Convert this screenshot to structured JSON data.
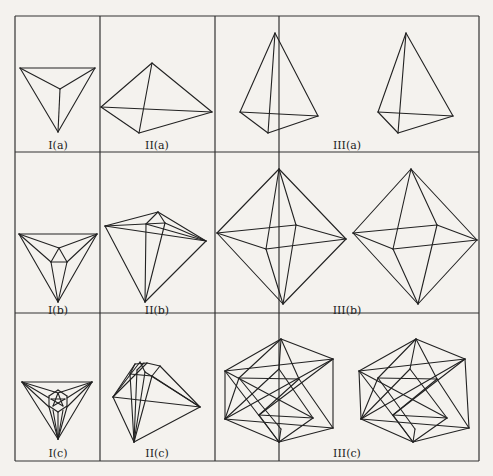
{
  "figure": {
    "columns": [
      "I",
      "II",
      "III"
    ],
    "rows": [
      "a",
      "b",
      "c"
    ],
    "cells": [
      {
        "id": "I(a)",
        "label": "I(a)",
        "shape": "triangular pyramid (top view)"
      },
      {
        "id": "II(a)",
        "label": "II(a)",
        "shape": "tetrahedron (oblique view)"
      },
      {
        "id": "III(a)",
        "label": "III(a)",
        "shape": "tetrahedron stereo pair"
      },
      {
        "id": "I(b)",
        "label": "I(b)",
        "shape": "subdivided pyramid (top view)"
      },
      {
        "id": "II(b)",
        "label": "II(b)",
        "shape": "subdivided polyhedron (oblique view)"
      },
      {
        "id": "III(b)",
        "label": "III(b)",
        "shape": "octahedron stereo pair"
      },
      {
        "id": "I(c)",
        "label": "I(c)",
        "shape": "refined polyhedron (top view)"
      },
      {
        "id": "II(c)",
        "label": "II(c)",
        "shape": "refined polyhedron (oblique view)"
      },
      {
        "id": "III(c)",
        "label": "III(c)",
        "shape": "icosahedron stereo pair"
      }
    ]
  },
  "labels": {
    "Ia": "I(a)",
    "IIa": "II(a)",
    "IIIa": "III(a)",
    "Ib": "I(b)",
    "IIb": "II(b)",
    "IIIb": "III(b)",
    "Ic": "I(c)",
    "IIc": "II(c)",
    "IIIc": "III(c)"
  }
}
